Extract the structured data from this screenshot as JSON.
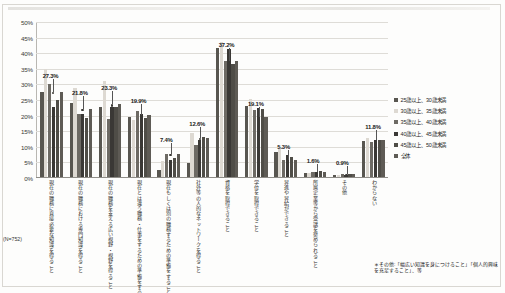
{
  "chart_data": {
    "type": "bar",
    "title": "",
    "xlabel": "",
    "ylabel": "",
    "ylim": [
      0,
      50
    ],
    "grid": true,
    "legend_position": "right",
    "ytick_labels": [
      "50%",
      "45%",
      "40%",
      "35%",
      "30%",
      "25%",
      "20%",
      "15%",
      "10%",
      "5%",
      "0%"
    ],
    "ytick_values": [
      50,
      45,
      40,
      35,
      30,
      25,
      20,
      15,
      10,
      5,
      0
    ],
    "categories": [
      "現在の職務に直接必要な知識を得ること",
      "現在の職務における専門知識を得ること",
      "現在の職務を支える広い視野・視野を得ること",
      "現在とは違う職務・仕事をするための準備をすること",
      "現在もしくは別の職務するための準備をすること",
      "社外等の人的なネットワークを得ること",
      "資格を取得できること",
      "学位を取得できること",
      "昇進や昇給ができること",
      "所属企業等から受講を奨められること",
      "その他",
      "わからない"
    ],
    "series": [
      {
        "name": "25歳以上、30歳未満",
        "color": "#585650",
        "values": [
          27.1,
          23.8,
          22.6,
          19.3,
          2.2,
          4.6,
          41.3,
          22.8,
          7.9,
          1.4,
          0.6,
          11.4
        ]
      },
      {
        "name": "30歳以上、35歳未満",
        "color": "#ddd9d2",
        "values": [
          34.6,
          28.4,
          30.8,
          18.2,
          5.1,
          14.1,
          43.2,
          25.1,
          9.6,
          1.2,
          0.5,
          12.4
        ]
      },
      {
        "name": "35歳以上、40歳未満",
        "color": "#6d6a64",
        "values": [
          29.8,
          20.1,
          18.7,
          21.3,
          7.4,
          10.2,
          37.2,
          21.6,
          5.3,
          1.6,
          0.9,
          11.1
        ]
      },
      {
        "name": "40歳以上、45歳未満",
        "color": "#3a3835",
        "values": [
          22.6,
          20.3,
          22.5,
          20.1,
          5.6,
          11.8,
          41.0,
          22.1,
          7.2,
          1.5,
          0.7,
          12.0
        ]
      },
      {
        "name": "45歳以上、50歳未満",
        "color": "#4f4d47",
        "values": [
          24.6,
          19.0,
          22.4,
          19.0,
          6.1,
          12.9,
          36.1,
          21.9,
          6.4,
          1.9,
          1.1,
          11.8
        ]
      },
      {
        "name": "全体",
        "color": "#5e5b55",
        "values": [
          27.3,
          21.8,
          23.3,
          19.9,
          7.4,
          12.6,
          37.2,
          19.1,
          5.3,
          1.6,
          0.9,
          11.8
        ]
      }
    ],
    "annotations": [
      {
        "label": "27.3%",
        "value": 27.3,
        "category_index": 0
      },
      {
        "label": "21.8%",
        "value": 21.8,
        "category_index": 1
      },
      {
        "label": "23.3%",
        "value": 23.3,
        "category_index": 2
      },
      {
        "label": "19.9%",
        "value": 19.9,
        "category_index": 3
      },
      {
        "label": "7.4%",
        "value": 7.4,
        "category_index": 4
      },
      {
        "label": "12.6%",
        "value": 12.6,
        "category_index": 5
      },
      {
        "label": "37.2%",
        "value": 37.2,
        "category_index": 6
      },
      {
        "label": "19.1%",
        "value": 19.1,
        "category_index": 7
      },
      {
        "label": "5.3%",
        "value": 5.3,
        "category_index": 8
      },
      {
        "label": "1.6%",
        "value": 1.6,
        "category_index": 9
      },
      {
        "label": "0.9%",
        "value": 0.9,
        "category_index": 10
      },
      {
        "label": "11.8%",
        "value": 11.8,
        "category_index": 11
      }
    ]
  },
  "sample_size_label": "(N=752)",
  "footnote": "＊その他:「幅広い知識を身につけること」「個人的興味を充足すること」、等",
  "header_strip": ""
}
